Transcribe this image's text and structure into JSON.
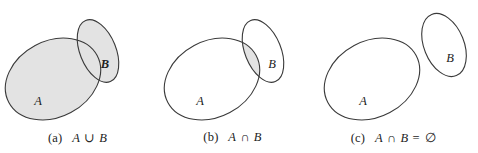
{
  "figure": {
    "background_color": "#ffffff",
    "stroke_color": "#3a3a3a",
    "shade_color": "#e3e3e3",
    "label_color": "#222222"
  },
  "panels": [
    {
      "id": "a",
      "tag": "(a)",
      "caption": "A ∪ B",
      "caption_parts": {
        "left_set": "A",
        "operator": "∪",
        "right_set": "B",
        "result": ""
      },
      "operation": "union",
      "shaded_region": "A ∪ B",
      "sets": [
        {
          "name": "A",
          "label": "A",
          "label_x": 38,
          "label_y": 105,
          "cx": 53,
          "cy": 79,
          "rx": 50,
          "ry": 38,
          "rotation": -28,
          "filled": true
        },
        {
          "name": "B",
          "label": "B",
          "label_x": 105,
          "label_y": 68,
          "cx": 98,
          "cy": 51,
          "rx": 18,
          "ry": 33,
          "rotation": -22,
          "filled": true
        }
      ]
    },
    {
      "id": "b",
      "tag": "(b)",
      "caption": "A ∩ B",
      "caption_parts": {
        "left_set": "A",
        "operator": "∩",
        "right_set": "B",
        "result": ""
      },
      "operation": "intersection",
      "shaded_region": "A ∩ B",
      "sets": [
        {
          "name": "A",
          "label": "A",
          "label_x": 45,
          "label_y": 105,
          "cx": 57,
          "cy": 79,
          "rx": 50,
          "ry": 38,
          "rotation": -28,
          "filled": false
        },
        {
          "name": "B",
          "label": "B",
          "label_x": 117,
          "label_y": 68,
          "cx": 108,
          "cy": 51,
          "rx": 18,
          "ry": 33,
          "rotation": -22,
          "filled": false
        }
      ]
    },
    {
      "id": "c",
      "tag": "(c)",
      "caption": "A ∩ B = ∅",
      "caption_parts": {
        "left_set": "A",
        "operator": "∩",
        "right_set": "B",
        "equals": "=",
        "result": "∅"
      },
      "operation": "disjoint",
      "shaded_region": "none",
      "sets": [
        {
          "name": "A",
          "label": "A",
          "label_x": 53,
          "label_y": 105,
          "cx": 62,
          "cy": 79,
          "rx": 50,
          "ry": 38,
          "rotation": -28,
          "filled": false
        },
        {
          "name": "B",
          "label": "B",
          "label_x": 140,
          "label_y": 62,
          "cx": 134,
          "cy": 45,
          "rx": 20,
          "ry": 33,
          "rotation": -22,
          "filled": false
        }
      ]
    }
  ]
}
